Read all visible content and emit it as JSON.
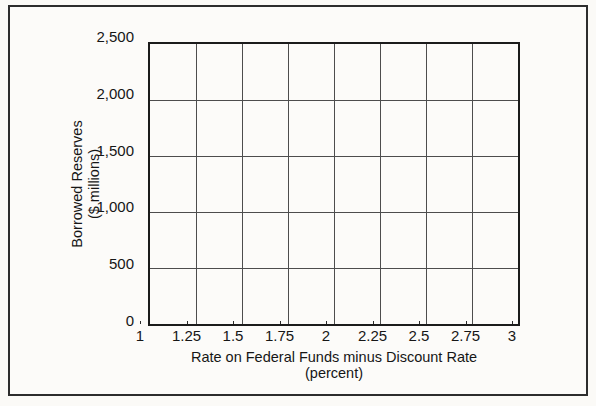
{
  "chart_data": {
    "type": "line",
    "series": [],
    "title": "",
    "xlabel": "Rate on Federal Funds minus Discount Rate",
    "xlabel_line2": "(percent)",
    "ylabel": "Borrowed Reserves",
    "ylabel_line2": "($ millions)",
    "xlim": [
      1,
      3
    ],
    "ylim": [
      0,
      2500
    ],
    "xticks": [
      1,
      1.25,
      1.5,
      1.75,
      2,
      2.25,
      2.5,
      2.75,
      3
    ],
    "xtick_labels": [
      "1",
      "1.25",
      "1.5",
      "1.75",
      "2",
      "2.25",
      "2.5",
      "2.75",
      "3"
    ],
    "yticks": [
      0,
      500,
      1000,
      1500,
      2000,
      2500
    ],
    "ytick_labels": [
      "0",
      "500",
      "1,000",
      "1,500",
      "2,000",
      "2,500"
    ],
    "grid": true,
    "legend": null,
    "colors": {
      "grid_line": "#4d4d4d",
      "axis_box": "#1b1b1b",
      "figure_border": "#2d2d2d",
      "paper": "#fbfaf7",
      "text": "#161616"
    }
  }
}
